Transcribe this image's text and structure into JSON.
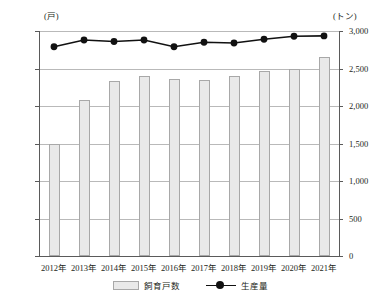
{
  "units": {
    "left": "(戸)",
    "right": "(トン)"
  },
  "legend": {
    "bar_label": "飼育戸数",
    "line_label": "生産量"
  },
  "chart_data": {
    "type": "bar",
    "title": "",
    "xlabel": "",
    "ylabel": "",
    "grid": true,
    "legend_position": "bottom",
    "categories": [
      "2012年",
      "2013年",
      "2014年",
      "2015年",
      "2016年",
      "2017年",
      "2018年",
      "2019年",
      "2020年",
      "2021年"
    ],
    "series": [
      {
        "name": "飼育戸数",
        "type": "bar",
        "axis": "left",
        "unit": "戸",
        "values": [
          5950,
          8300,
          9350,
          9600,
          9450,
          9400,
          9600,
          9850,
          10000,
          10600
        ]
      },
      {
        "name": "生産量",
        "type": "line",
        "axis": "right",
        "unit": "トン",
        "values": [
          2790,
          2880,
          2860,
          2880,
          2790,
          2850,
          2840,
          2890,
          2930,
          2935
        ]
      }
    ],
    "left_axis": {
      "ticks": [
        "0",
        "2,000",
        "4,000",
        "6,000",
        "8,000",
        "10,000",
        "12,000"
      ],
      "tick_values": [
        0,
        2000,
        4000,
        6000,
        8000,
        10000,
        12000
      ],
      "ylim": [
        0,
        12000
      ]
    },
    "right_axis": {
      "ticks": [
        "0",
        "500",
        "1,000",
        "1,500",
        "2,000",
        "2,500",
        "3,000"
      ],
      "tick_values": [
        0,
        500,
        1000,
        1500,
        2000,
        2500,
        3000
      ],
      "ylim": [
        0,
        3000
      ]
    },
    "colors": {
      "bar_fill": "#e9e9e9",
      "bar_border": "#a8a8a8",
      "line": "#111111",
      "grid": "#b9b9b9",
      "axis": "#5a5a5a"
    }
  }
}
